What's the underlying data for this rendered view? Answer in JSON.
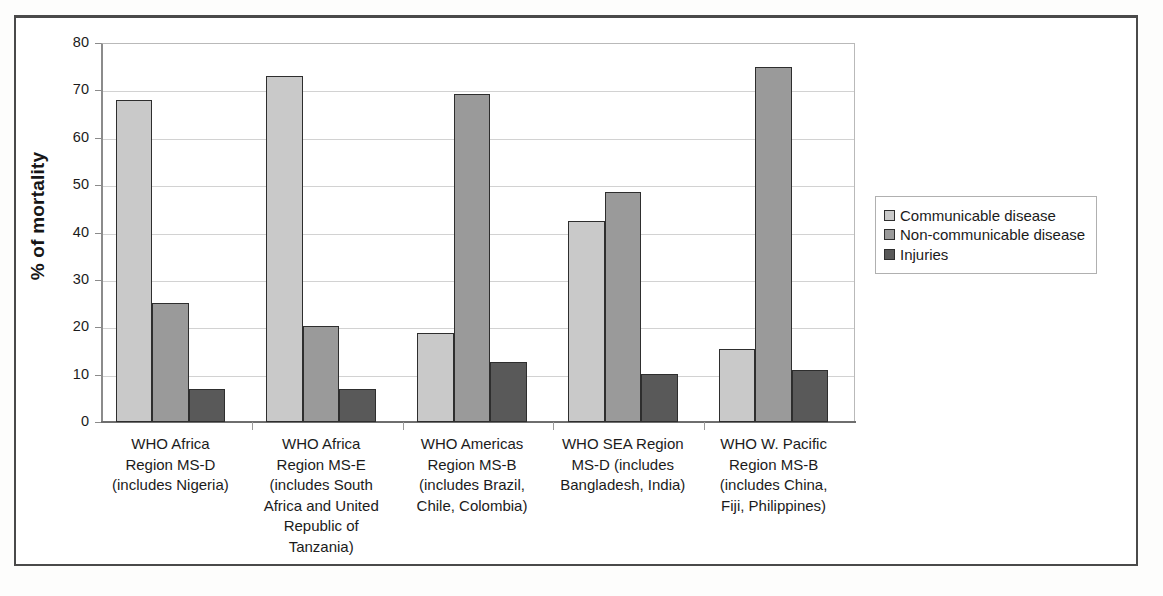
{
  "figure": {
    "border_color": "#4a4a4a",
    "background": "#ffffff"
  },
  "legend": {
    "position": "right",
    "items": [
      {
        "label": "Communicable disease",
        "color": "#c9c9c9",
        "swatch_name": "legend-swatch-communicable"
      },
      {
        "label": "Non-communicable disease",
        "color": "#9a9a9a",
        "swatch_name": "legend-swatch-non-communicable"
      },
      {
        "label": "Injuries",
        "color": "#595959",
        "swatch_name": "legend-swatch-injuries"
      }
    ]
  },
  "chart_data": {
    "type": "bar",
    "title": "",
    "xlabel": "",
    "ylabel": "% of mortality",
    "ylim": [
      0,
      80
    ],
    "yticks": [
      0,
      10,
      20,
      30,
      40,
      50,
      60,
      70,
      80
    ],
    "ytick_labels": [
      "0",
      "10",
      "20",
      "30",
      "40",
      "50",
      "60",
      "70",
      "80"
    ],
    "grid": true,
    "grid_axis": "y",
    "legend_position": "right",
    "categories": [
      "WHO Africa Region MS-D (includes Nigeria)",
      "WHO Africa Region MS-E (includes South Africa and United Republic of Tanzania)",
      "WHO Americas Region MS-B (includes Brazil, Chile, Colombia)",
      "WHO SEA Region MS-D (includes Bangladesh, India)",
      "WHO W. Pacific Region MS-B (includes China, Fiji, Philippines)"
    ],
    "category_lines": [
      [
        "WHO Africa",
        "Region MS-D",
        "(includes Nigeria)"
      ],
      [
        "WHO Africa",
        "Region MS-E",
        "(includes South",
        "Africa and United",
        "Republic of",
        "Tanzania)"
      ],
      [
        "WHO Americas",
        "Region MS-B",
        "(includes Brazil,",
        "Chile, Colombia)"
      ],
      [
        "WHO SEA Region",
        "MS-D (includes",
        "Bangladesh, India)"
      ],
      [
        "WHO W. Pacific",
        "Region MS-B",
        "(includes China,",
        "Fiji, Philippines)"
      ]
    ],
    "series": [
      {
        "name": "Communicable disease",
        "color": "#c9c9c9",
        "values": [
          68.0,
          73.0,
          18.8,
          42.5,
          15.4
        ]
      },
      {
        "name": "Non-communicable disease",
        "color": "#9a9a9a",
        "values": [
          25.1,
          20.2,
          69.3,
          48.5,
          75.0
        ]
      },
      {
        "name": "Injuries",
        "color": "#595959",
        "values": [
          6.9,
          7.0,
          12.6,
          10.2,
          11.0
        ]
      }
    ]
  }
}
